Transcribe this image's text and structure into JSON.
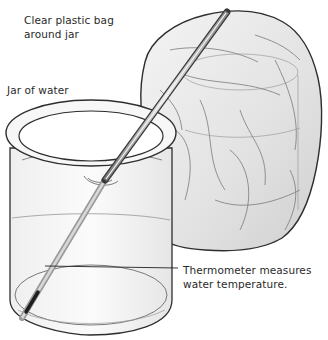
{
  "diagram": {
    "labels": {
      "bag_line1": "Clear plastic bag",
      "bag_line2": "around jar",
      "jar": "Jar of water",
      "thermometer_line1": "Thermometer measures",
      "thermometer_line2": "water temperature."
    },
    "components": [
      {
        "id": "plastic-bag",
        "name": "Clear plastic bag around jar"
      },
      {
        "id": "jar",
        "name": "Jar of water"
      },
      {
        "id": "thermometer",
        "name": "Thermometer"
      }
    ],
    "colors": {
      "line": "#3a3a3a",
      "shade": "#bdbdbd",
      "background": "#ffffff"
    }
  }
}
